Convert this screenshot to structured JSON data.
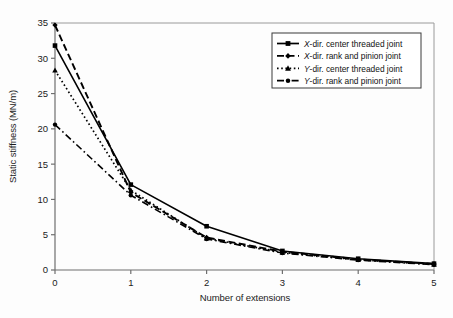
{
  "chart_data": {
    "type": "line",
    "title": "",
    "xlabel": "Number of extensions",
    "ylabel": "Static stiffness (MN/m)",
    "x": [
      0,
      1,
      2,
      3,
      4,
      5
    ],
    "xlim": [
      0,
      5
    ],
    "ylim": [
      0,
      35
    ],
    "xticks": [
      "0",
      "1",
      "2",
      "3",
      "4",
      "5"
    ],
    "yticks": [
      "0",
      "5",
      "10",
      "15",
      "20",
      "25",
      "30",
      "35"
    ],
    "grid": false,
    "legend_position": "top-right",
    "series": [
      {
        "name": "X-dir. center threaded joint",
        "name_italic_prefix": "X",
        "name_rest": "-dir. center threaded joint",
        "values": [
          31.8,
          12.1,
          6.2,
          2.7,
          1.6,
          0.9
        ],
        "line_style": "solid",
        "marker": "square",
        "color": "#000000"
      },
      {
        "name": "X-dir. rank and pinion joint",
        "name_italic_prefix": "X",
        "name_rest": "-dir. rank and pinion joint",
        "values": [
          34.7,
          11.0,
          4.6,
          2.6,
          1.5,
          0.85
        ],
        "line_style": "dashed",
        "marker": "diamond",
        "color": "#000000"
      },
      {
        "name": "Y-dir. center threaded joint",
        "name_italic_prefix": "Y",
        "name_rest": "-dir. center threaded joint",
        "values": [
          28.3,
          11.3,
          4.5,
          2.5,
          1.45,
          0.8
        ],
        "line_style": "dotted",
        "marker": "triangle",
        "color": "#000000"
      },
      {
        "name": "Y-dir. rank and pinion joint",
        "name_italic_prefix": "Y",
        "name_rest": "-dir. rank and pinion joint",
        "values": [
          20.6,
          10.6,
          4.4,
          2.4,
          1.4,
          0.75
        ],
        "line_style": "dashdot",
        "marker": "dot",
        "color": "#000000"
      }
    ]
  },
  "axes": {
    "x_label": "Number of extensions",
    "y_label": "Static stiffness (MN/m)"
  },
  "legend": {
    "items": [
      {
        "label": "X-dir. center threaded joint"
      },
      {
        "label": "X-dir. rank and pinion joint"
      },
      {
        "label": "Y-dir. center threaded joint"
      },
      {
        "label": "Y-dir. rank and pinion joint"
      }
    ]
  }
}
